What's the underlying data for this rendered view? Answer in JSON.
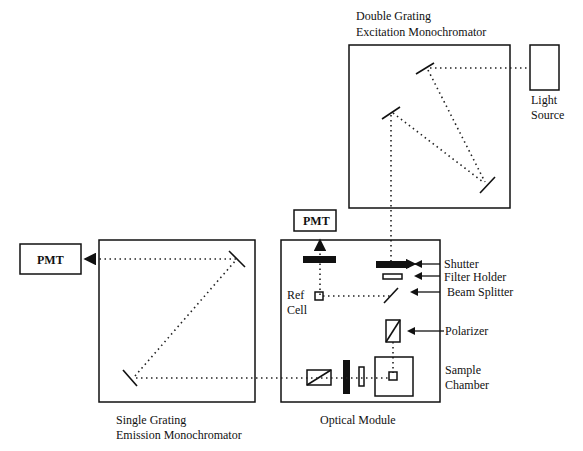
{
  "diagram": {
    "labels": {
      "excitation_mono": [
        "Double Grating",
        "Excitation Monochromator"
      ],
      "light_source": [
        "Light",
        "Source"
      ],
      "pmt_ref": "PMT",
      "pmt_emission": "PMT",
      "shutter": "Shutter",
      "filter_holder": "Filter Holder",
      "beam_splitter": "Beam Splitter",
      "ref_cell": [
        "Ref",
        "Cell"
      ],
      "polarizer": "Polarizer",
      "sample_chamber": [
        "Sample",
        "Chamber"
      ],
      "optical_module": "Optical Module",
      "emission_mono": [
        "Single Grating",
        "Emission Monochromator"
      ]
    },
    "colors": {
      "ink": "#111111",
      "background": "#ffffff"
    }
  }
}
